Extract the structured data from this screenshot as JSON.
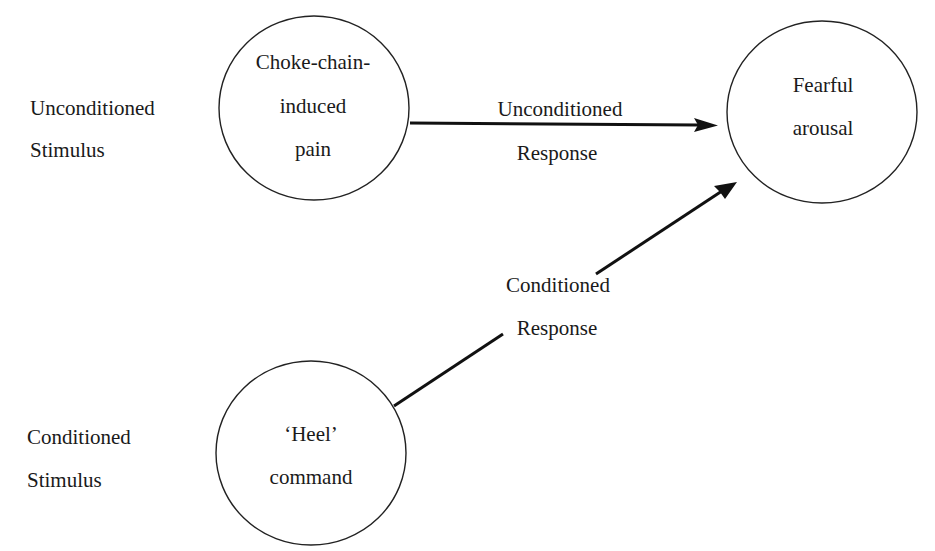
{
  "diagram": {
    "type": "classical-conditioning-flow",
    "row_labels": {
      "unconditioned_stimulus": [
        "Unconditioned",
        "Stimulus"
      ],
      "conditioned_stimulus": [
        "Conditioned",
        "Stimulus"
      ]
    },
    "nodes": {
      "us_node": {
        "lines": [
          "Choke-chain-",
          "induced",
          "pain"
        ]
      },
      "cs_node": {
        "lines": [
          "‘Heel’",
          "command"
        ]
      },
      "response_node": {
        "lines": [
          "Fearful",
          "arousal"
        ]
      }
    },
    "edges": {
      "unconditioned_response": {
        "from": "us_node",
        "to": "response_node",
        "lines": [
          "Unconditioned",
          "Response"
        ]
      },
      "conditioned_response": {
        "from": "cs_node",
        "to": "response_node",
        "lines": [
          "Conditioned",
          "Response"
        ]
      }
    },
    "colors": {
      "stroke": "#222222",
      "text": "#1a1a1a",
      "background": "#ffffff"
    }
  }
}
